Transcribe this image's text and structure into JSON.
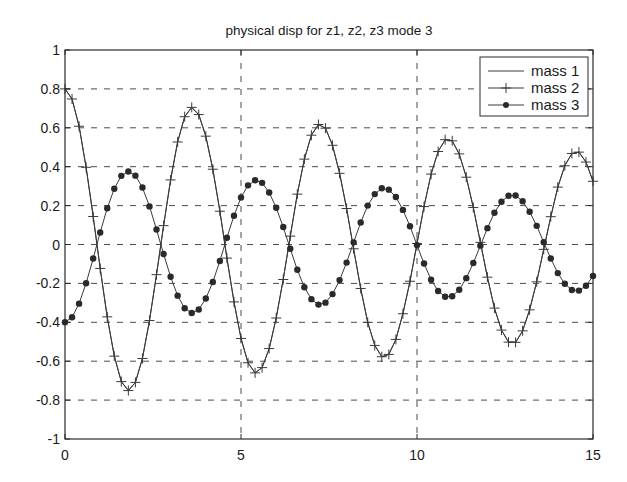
{
  "chart_data": {
    "type": "line",
    "title": "physical disp for z1, z2, z3 mode 3",
    "xlabel": "",
    "ylabel": "",
    "xlim": [
      0,
      15
    ],
    "ylim": [
      -1,
      1
    ],
    "grid": true,
    "legend_position": "upper right",
    "x_ticks": [
      0,
      5,
      10,
      15
    ],
    "x_tick_labels": [
      "0",
      "5",
      "10",
      "15"
    ],
    "y_ticks": [
      -1,
      -0.8,
      -0.6,
      -0.4,
      -0.2,
      0,
      0.2,
      0.4,
      0.6,
      0.8,
      1
    ],
    "y_tick_labels": [
      "-1",
      "-0.8",
      "-0.6",
      "-0.4",
      "-0.2",
      "0",
      "0.2",
      "0.4",
      "0.6",
      "0.8",
      "1"
    ],
    "x": [
      0,
      0.2,
      0.4,
      0.6,
      0.8,
      1.0,
      1.2,
      1.4,
      1.6,
      1.8,
      2.0,
      2.2,
      2.4,
      2.6,
      2.8,
      3.0,
      3.2,
      3.4,
      3.6,
      3.8,
      4.0,
      4.2,
      4.4,
      4.6,
      4.8,
      5.0,
      5.2,
      5.4,
      5.6,
      5.8,
      6.0,
      6.2,
      6.4,
      6.6,
      6.8,
      7.0,
      7.2,
      7.4,
      7.6,
      7.8,
      8.0,
      8.2,
      8.4,
      8.6,
      8.8,
      9.0,
      9.2,
      9.4,
      9.6,
      9.8,
      10.0,
      10.2,
      10.4,
      10.6,
      10.8,
      11.0,
      11.2,
      11.4,
      11.6,
      11.8,
      12.0,
      12.2,
      12.4,
      12.6,
      12.8,
      13.0,
      13.2,
      13.4,
      13.6,
      13.8,
      14.0,
      14.2,
      14.4,
      14.6,
      14.8,
      15.0
    ],
    "series": [
      {
        "name": "mass 1",
        "style": "solid line",
        "values": [
          0.8,
          0.748,
          0.608,
          0.397,
          0.144,
          -0.123,
          -0.372,
          -0.574,
          -0.705,
          -0.751,
          -0.709,
          -0.586,
          -0.391,
          -0.155,
          0.097,
          0.332,
          0.527,
          0.657,
          0.705,
          0.668,
          0.557,
          0.387,
          0.171,
          -0.07,
          -0.295,
          -0.483,
          -0.608,
          -0.66,
          -0.633,
          -0.535,
          -0.378,
          -0.18,
          0.043,
          0.259,
          0.439,
          0.562,
          0.617,
          0.598,
          0.51,
          0.366,
          0.185,
          -0.022,
          -0.226,
          -0.4,
          -0.519,
          -0.577,
          -0.565,
          -0.488,
          -0.356,
          -0.189,
          0.005,
          0.195,
          0.362,
          0.478,
          0.539,
          0.533,
          0.466,
          0.346,
          0.19,
          0.011,
          -0.168,
          -0.327,
          -0.44,
          -0.502,
          -0.503,
          -0.444,
          -0.336,
          -0.192,
          -0.025,
          0.143,
          0.295,
          0.405,
          0.468,
          0.475,
          0.424,
          0.325
        ]
      },
      {
        "name": "mass 2",
        "style": "solid line with + markers",
        "values": [
          0.8,
          0.748,
          0.608,
          0.397,
          0.144,
          -0.123,
          -0.372,
          -0.574,
          -0.705,
          -0.751,
          -0.709,
          -0.586,
          -0.391,
          -0.155,
          0.097,
          0.332,
          0.527,
          0.657,
          0.705,
          0.668,
          0.557,
          0.387,
          0.171,
          -0.07,
          -0.295,
          -0.483,
          -0.608,
          -0.66,
          -0.633,
          -0.535,
          -0.378,
          -0.18,
          0.043,
          0.259,
          0.439,
          0.562,
          0.617,
          0.598,
          0.51,
          0.366,
          0.185,
          -0.022,
          -0.226,
          -0.4,
          -0.519,
          -0.577,
          -0.565,
          -0.488,
          -0.356,
          -0.189,
          0.005,
          0.195,
          0.362,
          0.478,
          0.539,
          0.533,
          0.466,
          0.346,
          0.19,
          0.011,
          -0.168,
          -0.327,
          -0.44,
          -0.502,
          -0.503,
          -0.444,
          -0.336,
          -0.192,
          -0.025,
          0.143,
          0.295,
          0.405,
          0.468,
          0.475,
          0.424,
          0.325
        ]
      },
      {
        "name": "mass 3",
        "style": "solid line with filled circle markers",
        "values": [
          -0.4,
          -0.374,
          -0.304,
          -0.199,
          -0.072,
          0.062,
          0.186,
          0.287,
          0.353,
          0.375,
          0.354,
          0.293,
          0.196,
          0.077,
          -0.049,
          -0.166,
          -0.263,
          -0.328,
          -0.352,
          -0.334,
          -0.278,
          -0.193,
          -0.085,
          0.035,
          0.148,
          0.242,
          0.304,
          0.33,
          0.317,
          0.267,
          0.189,
          0.09,
          -0.022,
          -0.13,
          -0.22,
          -0.281,
          -0.309,
          -0.299,
          -0.255,
          -0.183,
          -0.093,
          0.011,
          0.113,
          0.2,
          0.259,
          0.289,
          0.282,
          0.244,
          0.178,
          0.094,
          -0.003,
          -0.098,
          -0.181,
          -0.239,
          -0.269,
          -0.266,
          -0.233,
          -0.173,
          -0.095,
          -0.006,
          0.084,
          0.163,
          0.22,
          0.251,
          0.252,
          0.222,
          0.168,
          0.096,
          0.012,
          -0.072,
          -0.147,
          -0.202,
          -0.234,
          -0.237,
          -0.212,
          -0.162
        ]
      }
    ],
    "legend": [
      "mass 1",
      "mass 2",
      "mass 3"
    ]
  },
  "colors": {
    "line": "#3a3a3a",
    "axis": "#2a2a2a",
    "grid": "#4a4a4a",
    "background": "#ffffff"
  }
}
